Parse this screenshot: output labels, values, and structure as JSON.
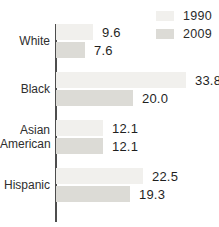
{
  "chart_data": {
    "type": "bar",
    "orientation": "horizontal",
    "title": "",
    "xlabel": "",
    "ylabel": "",
    "grid": false,
    "legend_position": "top-right",
    "categories": [
      "White",
      "Black",
      "Asian American",
      "Hispanic"
    ],
    "series": [
      {
        "name": "1990",
        "color": "#f1f0ed",
        "values": [
          9.6,
          33.8,
          12.1,
          22.5
        ],
        "value_labels": [
          "9.6",
          "33.8",
          "12.1",
          "22.5"
        ]
      },
      {
        "name": "2009",
        "color": "#dcdbd6",
        "values": [
          7.6,
          20.0,
          12.1,
          19.3
        ],
        "value_labels": [
          "7.6",
          "20.0",
          "12.1",
          "19.3"
        ]
      }
    ],
    "axis_color": "#4d4d4d"
  }
}
